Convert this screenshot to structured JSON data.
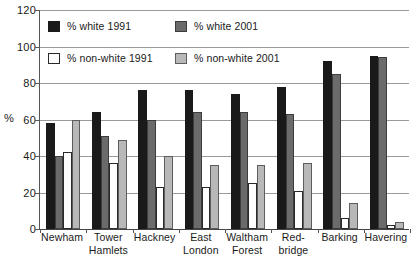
{
  "chart_data": {
    "type": "bar",
    "title": "",
    "xlabel": "",
    "ylabel": "%",
    "ylim": [
      0,
      120
    ],
    "yticks": [
      0,
      20,
      40,
      60,
      80,
      100,
      120
    ],
    "grid": true,
    "legend_position": "inside-top-left",
    "categories": [
      "Newham",
      "Tower Hamlets",
      "Hackney",
      "East London",
      "Waltham Forest",
      "Red-bridge",
      "Barking",
      "Havering"
    ],
    "category_lines": [
      [
        "Newham"
      ],
      [
        "Tower",
        "Hamlets"
      ],
      [
        "Hackney"
      ],
      [
        "East",
        "London"
      ],
      [
        "Waltham",
        "Forest"
      ],
      [
        "Red-",
        "bridge"
      ],
      [
        "Barking"
      ],
      [
        "Havering"
      ]
    ],
    "series": [
      {
        "name": "% white 1991",
        "color": "#1a1a1a",
        "style": "s-black",
        "values": [
          58,
          64,
          76,
          76,
          74,
          78,
          92,
          95
        ]
      },
      {
        "name": "% white 2001",
        "color": "#6b6b6b",
        "style": "s-dgray",
        "values": [
          40,
          51,
          60,
          64,
          64,
          63,
          85,
          94
        ]
      },
      {
        "name": "% non-white 1991",
        "color": "#ffffff",
        "style": "s-white",
        "values": [
          42,
          36,
          23,
          23,
          25,
          21,
          6,
          2
        ]
      },
      {
        "name": "% non-white 2001",
        "color": "#b8b8b8",
        "style": "s-lgray",
        "values": [
          60,
          49,
          40,
          35,
          35,
          36,
          14,
          4
        ]
      }
    ]
  },
  "legend": {
    "items": [
      {
        "label": "% white 1991",
        "style": "s-black"
      },
      {
        "label": "% white 2001",
        "style": "s-dgray"
      },
      {
        "label": "% non-white 1991",
        "style": "s-white"
      },
      {
        "label": "% non-white 2001",
        "style": "s-lgray"
      }
    ]
  },
  "colors": {
    "white_1991": "#1a1a1a",
    "white_2001": "#6b6b6b",
    "non_white_1991": "#ffffff",
    "non_white_2001": "#b8b8b8",
    "gridline": "#9a9a9a",
    "axis": "#444444"
  }
}
